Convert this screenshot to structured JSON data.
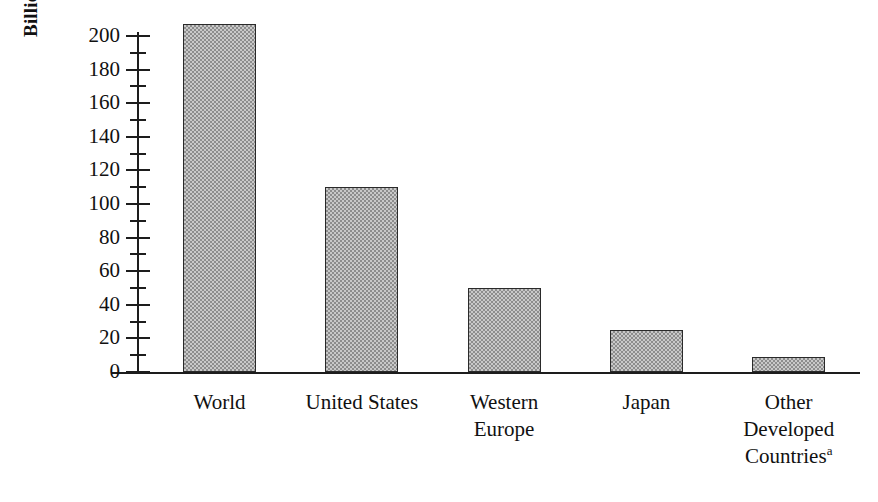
{
  "chart_data": {
    "type": "bar",
    "title": "",
    "subtitle": "",
    "xlabel": "",
    "ylabel": "Billions of US dollars",
    "categories": [
      "World",
      "United States",
      "Western Europe",
      "Japan",
      "Other Developed Countries"
    ],
    "category_lines": [
      [
        "World"
      ],
      [
        "United States"
      ],
      [
        "Western",
        "Europe"
      ],
      [
        "Japan"
      ],
      [
        "Other",
        "Developed",
        "Countries"
      ]
    ],
    "values": [
      207,
      110,
      50,
      25,
      9
    ],
    "ylim": [
      0,
      210
    ],
    "ytick_major": [
      0,
      20,
      40,
      60,
      80,
      100,
      120,
      140,
      160,
      180,
      200
    ],
    "ytick_minor": [
      10,
      30,
      50,
      70,
      90,
      110,
      130,
      150,
      170,
      190
    ],
    "ytick_labels": [
      "0",
      "20",
      "40",
      "60",
      "80",
      "100",
      "120",
      "140",
      "160",
      "180",
      "200"
    ],
    "grid": false,
    "legend": null,
    "legend_position": "none",
    "annotations": [
      {
        "target": "Other Developed Countries",
        "marker": "a"
      }
    ],
    "colors": {
      "bar_fill": "#c9c9c9",
      "bar_pattern": "#8d8d8d",
      "bar_border": "#2a2a2a",
      "axis": "#1d1d1d",
      "text": "#111111",
      "background": "#ffffff"
    }
  }
}
